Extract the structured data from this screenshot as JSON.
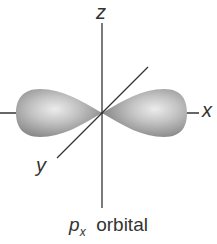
{
  "diagram": {
    "axes": {
      "x_label": "x",
      "y_label": "y",
      "z_label": "z"
    },
    "caption": {
      "symbol": "p",
      "subscript": "x",
      "text": "orbital"
    },
    "colors": {
      "lobe_edge": "#8a8a8a",
      "lobe_center": "#e6e6e6",
      "axis": "#333333"
    }
  }
}
